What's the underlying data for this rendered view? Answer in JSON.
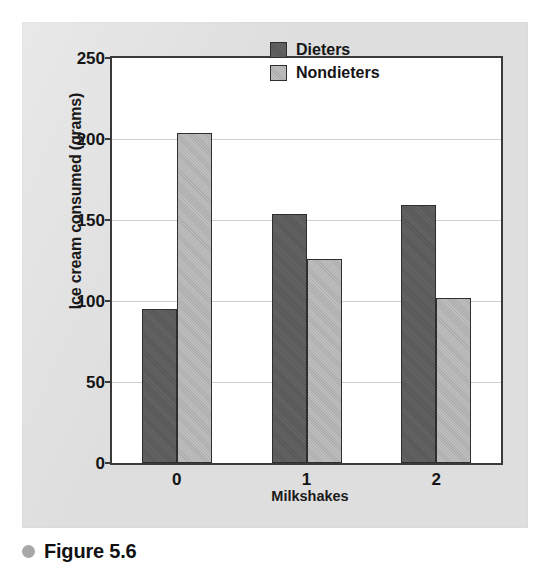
{
  "caption": {
    "bullet_icon": "filled-circle-bullet",
    "text": "Figure 5.6",
    "bullet_color": "#a8a8a8"
  },
  "legend": {
    "position": "top-right-inside",
    "entries": [
      {
        "label": "Dieters",
        "color": "#5c5c5c"
      },
      {
        "label": "Nondieters",
        "color": "#b6b6b6"
      }
    ]
  },
  "colors": {
    "panel_background": "#e3e3e3",
    "plot_background": "#ffffff",
    "axis_line": "#3a3a3a",
    "gridline": "#cfcfcf",
    "dieters": "#5c5c5c",
    "nondieters": "#b6b6b6",
    "text": "#151515"
  },
  "chart_data": {
    "type": "bar",
    "title": "",
    "xlabel": "Milkshakes",
    "ylabel": "Ice cream consumed (grams)",
    "categories": [
      "0",
      "1",
      "2"
    ],
    "series": [
      {
        "name": "Dieters",
        "color": "#5c5c5c",
        "values": [
          95,
          154,
          159
        ]
      },
      {
        "name": "Nondieters",
        "color": "#b6b6b6",
        "values": [
          204,
          126,
          102
        ]
      }
    ],
    "ylim": [
      0,
      250
    ],
    "yticks": [
      0,
      50,
      100,
      150,
      200,
      250
    ],
    "ytick_labels": [
      "0",
      "50",
      "100",
      "150",
      "200",
      "250"
    ],
    "grid": true,
    "grid_axis": "y",
    "legend_position": "upper right"
  }
}
